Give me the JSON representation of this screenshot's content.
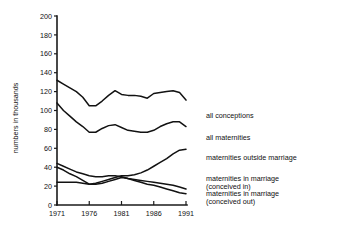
{
  "chart_data": {
    "type": "line",
    "title": "",
    "xlabel": "",
    "ylabel": "numbers in thousands",
    "xlim": [
      1971,
      1991
    ],
    "ylim": [
      0,
      200
    ],
    "grid": false,
    "legend_position": "right-of-line-ends",
    "yticks": [
      "0",
      "20",
      "40",
      "60",
      "80",
      "100",
      "120",
      "140",
      "160",
      "180",
      "200"
    ],
    "xticks": [
      "1971",
      "1976",
      "1981",
      "1986",
      "1991"
    ],
    "x": [
      1971,
      1972,
      1973,
      1974,
      1975,
      1976,
      1977,
      1978,
      1979,
      1980,
      1981,
      1982,
      1983,
      1984,
      1985,
      1986,
      1987,
      1988,
      1989,
      1990,
      1991
    ],
    "series": [
      {
        "name": "all conceptions",
        "label": "all conceptions",
        "values": [
          132,
          128,
          124,
          120,
          114,
          105,
          105,
          110,
          116,
          121,
          117,
          116,
          116,
          115,
          113,
          118,
          119,
          120,
          121,
          119,
          111
        ]
      },
      {
        "name": "all maternities",
        "label": "all maternities",
        "values": [
          108,
          100,
          94,
          88,
          83,
          77,
          77,
          81,
          84,
          85,
          82,
          79,
          78,
          77,
          77,
          79,
          83,
          86,
          88,
          88,
          83
        ]
      },
      {
        "name": "maternities outside marriage",
        "label": "maternities outside marriage",
        "values": [
          24,
          24,
          24,
          24,
          23,
          22,
          23,
          25,
          27,
          29,
          31,
          31,
          32,
          34,
          37,
          41,
          45,
          49,
          54,
          58,
          59
        ]
      },
      {
        "name": "maternities in marriage (conceived in)",
        "label_line1": "maternities in marriage",
        "label_line2": "(conceived in)",
        "values": [
          44,
          41,
          38,
          35,
          33,
          31,
          30,
          30,
          31,
          31,
          30,
          28,
          27,
          26,
          25,
          24,
          23,
          22,
          21,
          19,
          17
        ]
      },
      {
        "name": "maternities in marriage (conceived out)",
        "label_line1": "maternities in marriage",
        "label_line2": "(conceived out)",
        "values": [
          40,
          37,
          33,
          30,
          26,
          22,
          22,
          23,
          25,
          27,
          29,
          28,
          26,
          24,
          22,
          21,
          19,
          17,
          15,
          13,
          12
        ]
      }
    ]
  },
  "colors": {
    "line": "#121212",
    "axis": "#1a1a1a",
    "text": "#101010",
    "background": "#ffffff"
  }
}
